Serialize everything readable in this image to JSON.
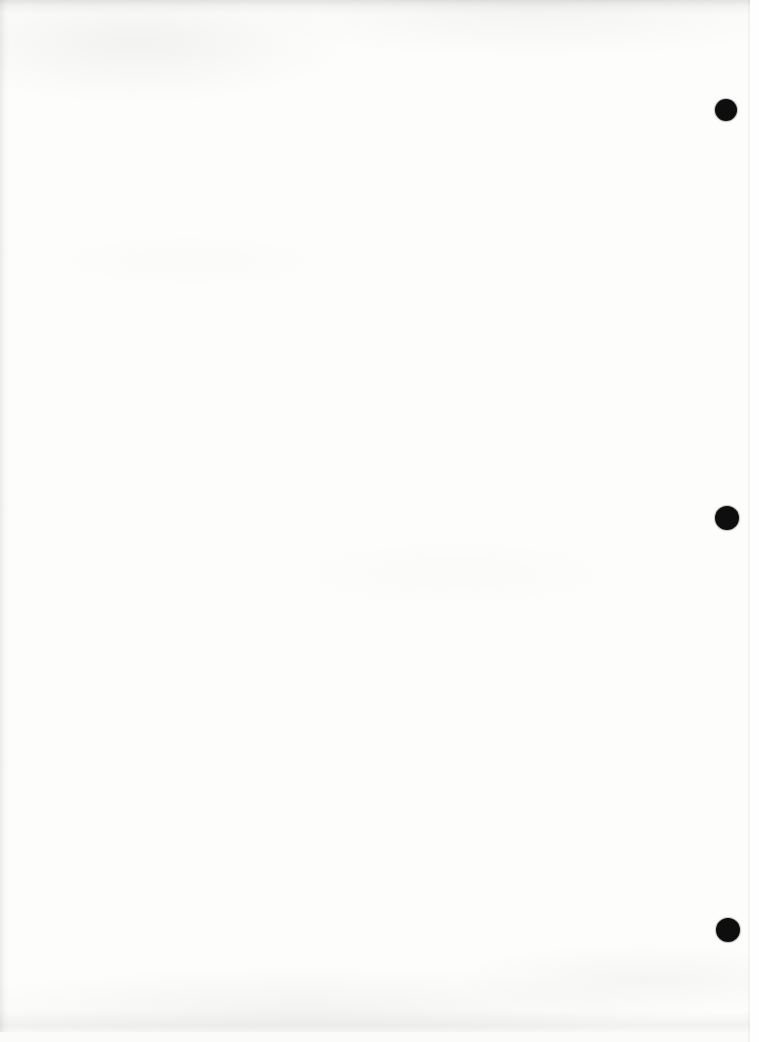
{
  "document": {
    "type": "scanned-blank-page",
    "text_content": "",
    "paper_color": "#fdfdfc",
    "right_edge_margin_color": "#fefefe"
  },
  "paper_edge_line": {
    "x": 748
  },
  "hole_punches": {
    "color": "#0e0e0e",
    "items": [
      {
        "cx": 726,
        "cy": 110,
        "d": 22
      },
      {
        "cx": 727,
        "cy": 518,
        "d": 24
      },
      {
        "cx": 728,
        "cy": 930,
        "d": 24
      }
    ]
  }
}
